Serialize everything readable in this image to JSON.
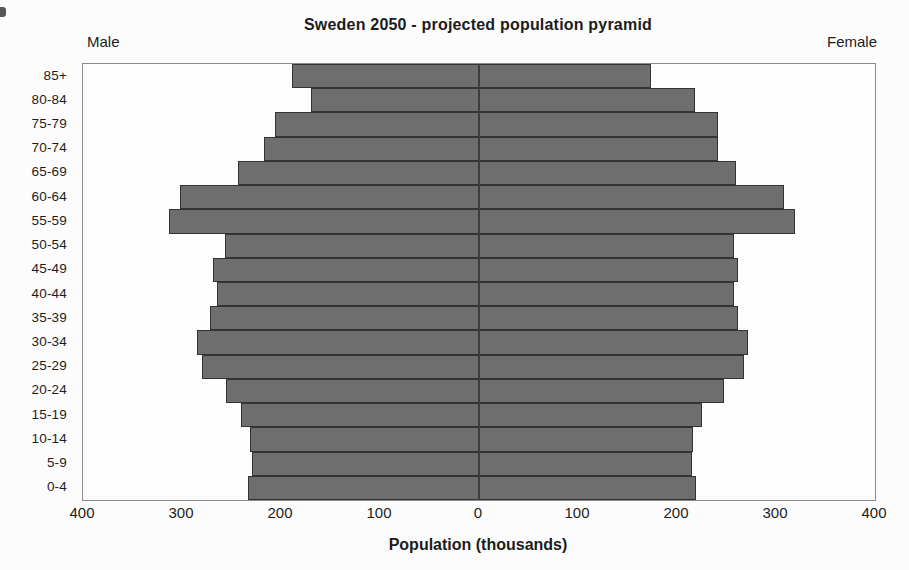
{
  "chart_data": {
    "type": "bar",
    "subtype": "population_pyramid",
    "title": "Sweden 2050 - projected population pyramid",
    "xlabel": "Population (thousands)",
    "side_labels": {
      "left": "Male",
      "right": "Female"
    },
    "unit": "thousands of people",
    "x_max_per_side": 400,
    "x_tick_labels": [
      "400",
      "300",
      "200",
      "100",
      "0",
      "100",
      "200",
      "300",
      "400"
    ],
    "grid": false,
    "legend_position": "none",
    "bar_fill_color": "#6e6e6e",
    "bar_border_color": "#333333",
    "categories": [
      "0-4",
      "5-9",
      "10-14",
      "15-19",
      "20-24",
      "25-29",
      "30-34",
      "35-39",
      "40-44",
      "45-49",
      "50-54",
      "55-59",
      "60-64",
      "65-69",
      "70-74",
      "75-79",
      "80-84",
      "85+"
    ],
    "categories_display_order": "oldest_at_top",
    "series": [
      {
        "name": "Male",
        "side": "left",
        "values": [
          233,
          229,
          231,
          240,
          256,
          280,
          285,
          272,
          265,
          269,
          257,
          313,
          302,
          243,
          217,
          206,
          170,
          189
        ]
      },
      {
        "name": "Female",
        "side": "right",
        "values": [
          219,
          215,
          216,
          225,
          247,
          268,
          272,
          262,
          258,
          262,
          258,
          319,
          308,
          260,
          241,
          241,
          218,
          174
        ]
      }
    ]
  }
}
